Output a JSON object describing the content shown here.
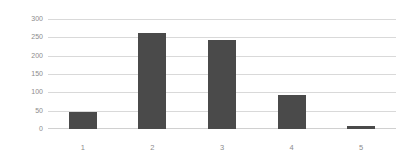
{
  "chart_data": {
    "type": "bar",
    "title": "",
    "subtitle": "",
    "xlabel": "",
    "ylabel": "",
    "categories": [
      "1",
      "2",
      "3",
      "4",
      "5"
    ],
    "values": [
      46,
      262,
      243,
      93,
      8
    ],
    "ylim": [
      0,
      300
    ],
    "yticks": [
      0,
      50,
      100,
      150,
      200,
      250,
      300
    ],
    "ytick_labels": [
      "0",
      "50",
      "100",
      "150",
      "200",
      "250",
      "300"
    ],
    "grid": "horizontal",
    "legend": "none",
    "annotations": [],
    "series": [
      {
        "name": "",
        "values": [
          46,
          262,
          243,
          93,
          8
        ],
        "color": "#4a4a4a"
      }
    ]
  },
  "style": {
    "bar_color": "#4a4a4a",
    "gridline_color": "#d9d9d9",
    "axis_line_color": "#d0d0d0",
    "tick_label_color": "#8c8c8c",
    "background": "#ffffff"
  }
}
